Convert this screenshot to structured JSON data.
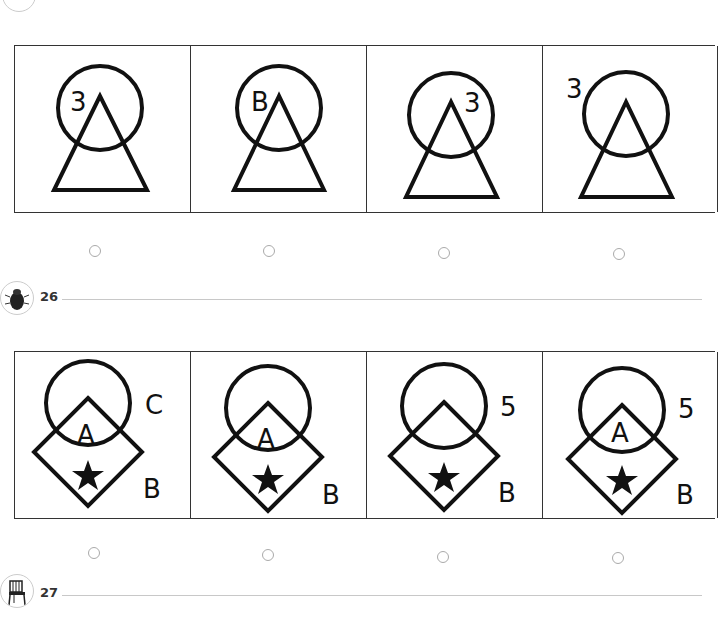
{
  "questions": [
    {
      "number": "25",
      "options": [
        {
          "label_text": "3",
          "label_position": "inside-circle-left"
        },
        {
          "label_text": "B",
          "label_position": "inside-circle-left"
        },
        {
          "label_text": "3",
          "label_position": "inside-circle-right"
        },
        {
          "label_text": "3",
          "label_position": "outside-circle-left"
        }
      ]
    },
    {
      "number": "26",
      "icon": "beetle-icon",
      "options": [
        {
          "top_right": "C",
          "inner": "A",
          "bottom_right": "B"
        },
        {
          "top_right": "",
          "inner": "A",
          "bottom_right": "B"
        },
        {
          "top_right": "5",
          "inner": "",
          "bottom_right": "B"
        },
        {
          "top_right": "5",
          "inner": "A",
          "bottom_right": "B"
        }
      ]
    },
    {
      "number": "27",
      "icon": "chair-icon"
    }
  ],
  "labels": {
    "q26_number": "26",
    "q27_number": "27",
    "q25_o1": "3",
    "q25_o2": "B",
    "q25_o3": "3",
    "q25_o4": "3",
    "q26_o1_tr": "C",
    "q26_o1_in": "A",
    "q26_o1_br": "B",
    "q26_o2_in": "A",
    "q26_o2_br": "B",
    "q26_o3_tr": "5",
    "q26_o3_br": "B",
    "q26_o4_tr": "5",
    "q26_o4_in": "A",
    "q26_o4_br": "B"
  },
  "colors": {
    "ink": "#111111",
    "radio": "#aaaaaa",
    "rule": "#c8c8c8"
  }
}
